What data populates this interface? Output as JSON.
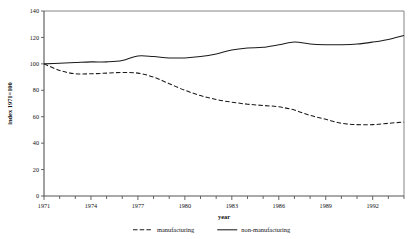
{
  "chart_data": {
    "type": "line",
    "title": "",
    "xlabel": "year",
    "ylabel": "index 1971=100",
    "xlim": [
      1971,
      1994
    ],
    "ylim": [
      0,
      140
    ],
    "ytick_values": [
      0,
      20,
      40,
      60,
      80,
      100,
      120,
      140
    ],
    "ytick_labels": [
      "0",
      "20",
      "40",
      "60",
      "80",
      "100",
      "120",
      "140"
    ],
    "xtick_values": [
      1971,
      1972,
      1973,
      1974,
      1975,
      1976,
      1977,
      1978,
      1979,
      1980,
      1981,
      1982,
      1983,
      1984,
      1985,
      1986,
      1987,
      1988,
      1989,
      1990,
      1991,
      1992,
      1993,
      1994
    ],
    "xtick_labels_shown": [
      "1971",
      "1974",
      "1977",
      "1980",
      "1983",
      "1986",
      "1989",
      "1992"
    ],
    "xtick_labeled_values": [
      1971,
      1974,
      1977,
      1980,
      1983,
      1986,
      1989,
      1992
    ],
    "grid": false,
    "legend_position": "bottom",
    "x": [
      1971,
      1972,
      1973,
      1974,
      1975,
      1976,
      1977,
      1978,
      1979,
      1980,
      1981,
      1982,
      1983,
      1984,
      1985,
      1986,
      1987,
      1988,
      1989,
      1990,
      1991,
      1992,
      1993,
      1994
    ],
    "series": [
      {
        "name": "manufacturing",
        "style": "dashed",
        "color": "#1b1b1b",
        "values": [
          100,
          95,
          92.5,
          92.5,
          93,
          93.5,
          93,
          90,
          85,
          80,
          76,
          73,
          71,
          69.5,
          68.5,
          67.5,
          65,
          61,
          58,
          55,
          54,
          54,
          55,
          56
        ]
      },
      {
        "name": "non-manufacturing",
        "style": "solid",
        "color": "#1b1b1b",
        "values": [
          100,
          100.5,
          101,
          101.5,
          101.5,
          102.5,
          106,
          105.5,
          104.5,
          104.5,
          105.5,
          107.5,
          110.5,
          112,
          112.5,
          114.5,
          116.5,
          115,
          114.5,
          114.5,
          115,
          116.5,
          118.5,
          121.5
        ]
      }
    ]
  },
  "legend": {
    "entries": [
      {
        "label": "manufacturing",
        "style": "dashed"
      },
      {
        "label": "non-manufacturing",
        "style": "solid"
      }
    ]
  }
}
